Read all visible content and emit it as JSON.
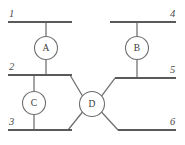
{
  "diagram": {
    "type": "electrical-single-line",
    "canvas": {
      "width": 185,
      "height": 145,
      "background": "#ffffff"
    },
    "colors": {
      "bus": "#5a5a5a",
      "branch": "#6e6e6e",
      "circle_stroke": "#6e6e6e",
      "circle_fill": "#ffffff",
      "text": "#3a3a3a",
      "bus_label_text": "#4a4a4a"
    },
    "buses": [
      {
        "id": "bus-1",
        "label": "1",
        "x1": 8,
        "x2": 72,
        "y": 22,
        "label_x": 9,
        "label_y": 17
      },
      {
        "id": "bus-2",
        "label": "2",
        "x1": 8,
        "x2": 72,
        "y": 75,
        "label_x": 9,
        "label_y": 70
      },
      {
        "id": "bus-3",
        "label": "3",
        "x1": 8,
        "x2": 72,
        "y": 130,
        "label_x": 9,
        "label_y": 125
      },
      {
        "id": "bus-4",
        "label": "4",
        "x1": 110,
        "x2": 176,
        "y": 22,
        "label_x": 170,
        "label_y": 17
      },
      {
        "id": "bus-5",
        "label": "5",
        "x1": 115,
        "x2": 176,
        "y": 78,
        "label_x": 170,
        "label_y": 73
      },
      {
        "id": "bus-6",
        "label": "6",
        "x1": 118,
        "x2": 176,
        "y": 130,
        "label_x": 170,
        "label_y": 125
      }
    ],
    "devices": [
      {
        "id": "device-a",
        "label": "A",
        "cx": 46,
        "cy": 48,
        "r": 11.5
      },
      {
        "id": "device-b",
        "label": "B",
        "cx": 137,
        "cy": 48,
        "r": 11.5
      },
      {
        "id": "device-c",
        "label": "C",
        "cx": 34,
        "cy": 103,
        "r": 11.5
      },
      {
        "id": "device-d",
        "label": "D",
        "cx": 92,
        "cy": 104,
        "r": 12.5
      }
    ],
    "branches": [
      {
        "id": "branch-bus1-to-a",
        "from": "bus-1",
        "to": "device-a",
        "x1": 46,
        "y1": 22,
        "x2": 46,
        "y2": 36.5
      },
      {
        "id": "branch-a-to-bus2",
        "from": "device-a",
        "to": "bus-2",
        "x1": 46,
        "y1": 59.5,
        "x2": 46,
        "y2": 75
      },
      {
        "id": "branch-bus4-to-b",
        "from": "bus-4",
        "to": "device-b",
        "x1": 137,
        "y1": 22,
        "x2": 137,
        "y2": 36.5
      },
      {
        "id": "branch-b-to-bus5",
        "from": "device-b",
        "to": "bus-5",
        "x1": 137,
        "y1": 59.5,
        "x2": 137,
        "y2": 78
      },
      {
        "id": "branch-bus2-to-c",
        "from": "bus-2",
        "to": "device-c",
        "x1": 34,
        "y1": 75,
        "x2": 34,
        "y2": 91.5
      },
      {
        "id": "branch-c-to-bus3",
        "from": "device-c",
        "to": "bus-3",
        "x1": 34,
        "y1": 114.5,
        "x2": 34,
        "y2": 130
      },
      {
        "id": "branch-d-to-bus2",
        "from": "device-d",
        "to": "bus-2",
        "x1": 82.5,
        "y1": 96,
        "x2": 70,
        "y2": 75
      },
      {
        "id": "branch-d-to-bus3",
        "from": "device-d",
        "to": "bus-3",
        "x1": 82.5,
        "y1": 112,
        "x2": 68,
        "y2": 130
      },
      {
        "id": "branch-d-to-bus5",
        "from": "device-d",
        "to": "bus-5",
        "x1": 101.5,
        "y1": 96,
        "x2": 115,
        "y2": 78
      },
      {
        "id": "branch-d-to-bus6",
        "from": "device-d",
        "to": "bus-6",
        "x1": 101.5,
        "y1": 112,
        "x2": 118,
        "y2": 130
      }
    ]
  }
}
